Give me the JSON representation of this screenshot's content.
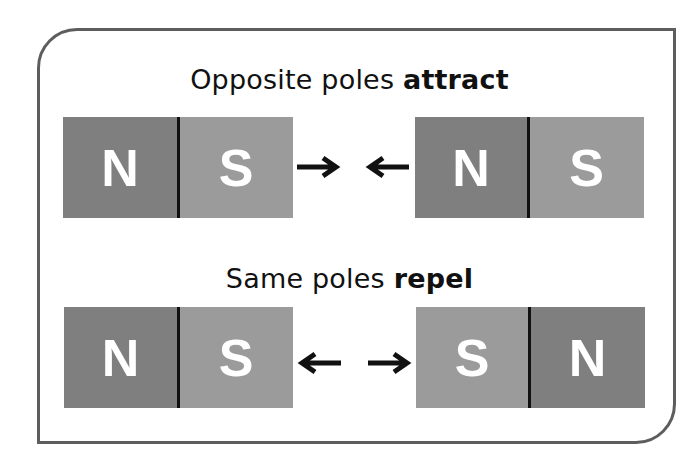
{
  "frame": {
    "border_color": "#5d5d5d"
  },
  "sections": [
    {
      "title_prefix": "Opposite poles ",
      "title_emphasis": "attract",
      "left_magnet": [
        {
          "label": "N",
          "pole": "north"
        },
        {
          "label": "S",
          "pole": "south"
        }
      ],
      "right_magnet": [
        {
          "label": "N",
          "pole": "north"
        },
        {
          "label": "S",
          "pole": "south"
        }
      ],
      "arrows": [
        "right-arrow",
        "left-arrow"
      ]
    },
    {
      "title_prefix": "Same poles ",
      "title_emphasis": "repel",
      "left_magnet": [
        {
          "label": "N",
          "pole": "north"
        },
        {
          "label": "S",
          "pole": "south"
        }
      ],
      "right_magnet": [
        {
          "label": "S",
          "pole": "south"
        },
        {
          "label": "N",
          "pole": "north"
        }
      ],
      "arrows": [
        "left-arrow",
        "right-arrow"
      ]
    }
  ],
  "colors": {
    "north": "#7f7f7f",
    "south": "#9b9b9b",
    "label": "#ffffff",
    "divider": "#111111",
    "arrow": "#111111",
    "text": "#111111"
  }
}
